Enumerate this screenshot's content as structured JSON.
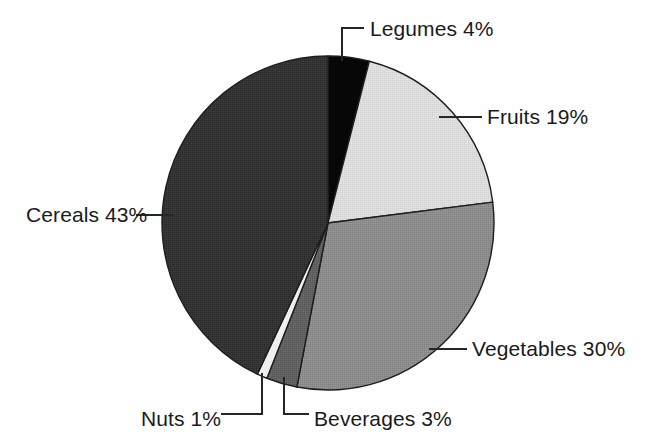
{
  "chart_data": {
    "type": "pie",
    "title": "",
    "subtitle": "",
    "xlabel": "",
    "ylabel": "",
    "legend_position": "none",
    "labels_outside": true,
    "unit": "%",
    "categories": [
      "Legumes",
      "Fruits",
      "Vegetables",
      "Beverages",
      "Nuts",
      "Cereals"
    ],
    "values": [
      4,
      19,
      30,
      3,
      1,
      43
    ],
    "total": 100,
    "start_angle_deg": 0,
    "direction": "clockwise",
    "slices": [
      {
        "name": "Legumes",
        "value": 4,
        "label": "Legumes 4%",
        "color": "#070707",
        "start_deg": 0,
        "end_deg": 14.4
      },
      {
        "name": "Fruits",
        "value": 19,
        "label": "Fruits 19%",
        "color": "#dcdcdc",
        "start_deg": 14.4,
        "end_deg": 82.8
      },
      {
        "name": "Vegetables",
        "value": 30,
        "label": "Vegetables 30%",
        "color": "#8c8c8c",
        "start_deg": 82.8,
        "end_deg": 190.8
      },
      {
        "name": "Beverages",
        "value": 3,
        "label": "Beverages 3%",
        "color": "#616161",
        "start_deg": 190.8,
        "end_deg": 201.6
      },
      {
        "name": "Nuts",
        "value": 1,
        "label": "Nuts 1%",
        "color": "#efefef",
        "start_deg": 201.6,
        "end_deg": 205.2
      },
      {
        "name": "Cereals",
        "value": 43,
        "label": "Cereals 43%",
        "color": "#333333",
        "start_deg": 205.2,
        "end_deg": 360
      }
    ],
    "geometry": {
      "center_x": 328,
      "center_y": 223,
      "radius_x": 166,
      "radius_y": 167
    },
    "colors": {
      "outline": "#1d1d1d",
      "leader": "#262626",
      "text": "#1a1a1a",
      "background": "#ffffff"
    }
  }
}
